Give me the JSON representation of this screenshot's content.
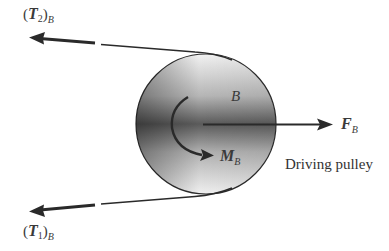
{
  "diagram": {
    "type": "free-body diagram",
    "pulley": {
      "label": "B",
      "caption": "Driving pulley",
      "center": [
        206,
        124
      ],
      "radius": 70
    },
    "forces": {
      "T2": {
        "symbol": "T",
        "index": "2",
        "subscript": "B",
        "direction": "left",
        "position": "top"
      },
      "T1": {
        "symbol": "T",
        "index": "1",
        "subscript": "B",
        "direction": "left",
        "position": "bottom"
      },
      "F": {
        "symbol": "F",
        "subscript": "B",
        "direction": "right"
      },
      "M": {
        "symbol": "M",
        "subscript": "B",
        "direction": "clockwise"
      }
    },
    "colors": {
      "line": "#2a2a2a",
      "pulley_dark": "#4a4a4a",
      "pulley_light": "#e8e8e8",
      "text": "#3a3a3a"
    }
  }
}
